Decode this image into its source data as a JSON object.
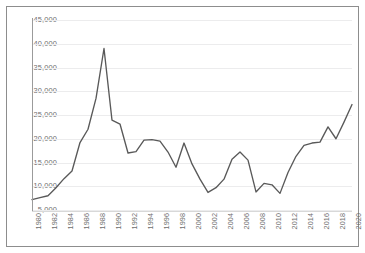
{
  "chart_data": {
    "type": "line",
    "title": "",
    "subtitle": "",
    "xlabel": "",
    "ylabel": "",
    "grid": true,
    "legend": false,
    "legend_position": "none",
    "line_color": "#595959",
    "gridline_color": "#ececed",
    "axis_color": "#9b9b9b",
    "border_color": "#8d8d8d",
    "tick_label_color": "#6d6d6d",
    "xlim": [
      1980,
      2020
    ],
    "ylim": [
      5000,
      45000
    ],
    "ytick_values": [
      5000,
      10000,
      15000,
      20000,
      25000,
      30000,
      35000,
      40000,
      45000
    ],
    "ytick_labels": [
      "5,000",
      "10,000",
      "15,000",
      "20,000",
      "25,000",
      "30,000",
      "35,000",
      "40,000",
      "45,000"
    ],
    "xtick_labels": [
      "1980",
      "1982",
      "1984",
      "1986",
      "1988",
      "1990",
      "1992",
      "1994",
      "1996",
      "1998",
      "2000",
      "2002",
      "2004",
      "2006",
      "2008",
      "2010",
      "2012",
      "2014",
      "2016",
      "2018",
      "2020"
    ],
    "xtick_rotation": -90,
    "x": [
      1980,
      1981,
      1982,
      1983,
      1984,
      1985,
      1986,
      1987,
      1988,
      1989,
      1990,
      1991,
      1992,
      1993,
      1994,
      1995,
      1996,
      1997,
      1998,
      1999,
      2000,
      2001,
      2002,
      2003,
      2004,
      2005,
      2006,
      2007,
      2008,
      2009,
      2010,
      2011,
      2012,
      2013,
      2014,
      2015,
      2016,
      2017,
      2018,
      2019,
      2020
    ],
    "values": [
      7200,
      7600,
      8000,
      9700,
      11600,
      13200,
      19200,
      22000,
      28500,
      39000,
      23900,
      23100,
      17000,
      17300,
      19700,
      19800,
      19500,
      17200,
      14000,
      19100,
      14700,
      11500,
      8700,
      9700,
      11500,
      15700,
      17200,
      15500,
      8800,
      10600,
      10300,
      8500,
      12900,
      16300,
      18600,
      19100,
      19300,
      22500,
      20000,
      23500,
      27200
    ]
  }
}
